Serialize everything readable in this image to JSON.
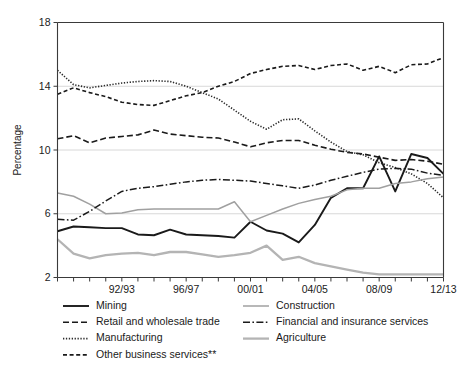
{
  "figure": {
    "background_color": "#ffffff",
    "axis_color": "#3a3a3a",
    "grid_color": "#d8d8d8"
  },
  "chart_data": {
    "type": "line",
    "title": "",
    "xlabel": "",
    "ylabel": "Percentage",
    "ylim": [
      2,
      18
    ],
    "yticks": [
      2,
      6,
      10,
      14,
      18
    ],
    "ytick_labels": [
      "2",
      "6",
      "10",
      "14",
      "18"
    ],
    "grid": true,
    "grid_axis": "y",
    "legend_position": "below-axes",
    "legend_columns": 2,
    "x": [
      "88/89",
      "89/90",
      "90/91",
      "91/92",
      "92/93",
      "93/94",
      "94/95",
      "95/96",
      "96/97",
      "97/98",
      "98/99",
      "99/00",
      "00/01",
      "01/02",
      "02/03",
      "03/04",
      "04/05",
      "05/06",
      "06/07",
      "07/08",
      "08/09",
      "09/10",
      "10/11",
      "11/12",
      "12/13"
    ],
    "xtick_labels": [
      "92/93",
      "96/97",
      "00/01",
      "04/05",
      "08/09",
      "12/13"
    ],
    "xtick_label_indices": [
      4,
      8,
      12,
      16,
      20,
      24
    ],
    "series": [
      {
        "name": "Mining",
        "color": "#1a1a1a",
        "dash": "none",
        "width": 1.9,
        "values": [
          4.9,
          5.2,
          5.15,
          5.1,
          5.1,
          4.7,
          4.65,
          5.0,
          4.7,
          4.65,
          4.6,
          4.5,
          5.5,
          4.95,
          4.75,
          4.2,
          5.3,
          7.0,
          7.6,
          7.6,
          9.6,
          7.4,
          9.75,
          9.5,
          8.5
        ]
      },
      {
        "name": "Retail and wholesale trade",
        "color": "#1a1a1a",
        "dash": "dashed",
        "width": 1.6,
        "values": [
          10.7,
          10.9,
          10.45,
          10.75,
          10.85,
          10.95,
          11.25,
          11.0,
          10.9,
          10.8,
          10.75,
          10.5,
          10.2,
          10.45,
          10.6,
          10.6,
          10.3,
          10.05,
          9.85,
          9.75,
          9.55,
          9.35,
          9.4,
          9.3,
          9.1
        ]
      },
      {
        "name": "Manufacturing",
        "color": "#2b2b2b",
        "dash": "dotted",
        "width": 1.6,
        "values": [
          15.0,
          14.1,
          13.9,
          14.05,
          14.2,
          14.3,
          14.35,
          14.3,
          14.0,
          13.6,
          13.2,
          12.5,
          11.8,
          11.3,
          11.9,
          11.95,
          11.2,
          10.5,
          9.9,
          9.7,
          9.2,
          8.9,
          8.5,
          7.9,
          7.0
        ]
      },
      {
        "name": "Other business services**",
        "color": "#1a1a1a",
        "dash": "dash-short",
        "width": 1.6,
        "values": [
          13.5,
          13.9,
          13.6,
          13.35,
          13.0,
          12.85,
          12.8,
          13.1,
          13.4,
          13.6,
          14.0,
          14.3,
          14.8,
          15.05,
          15.25,
          15.3,
          15.05,
          15.3,
          15.4,
          15.0,
          15.25,
          14.85,
          15.35,
          15.4,
          15.8
        ]
      },
      {
        "name": "Construction",
        "color": "#a0a0a0",
        "dash": "none",
        "width": 1.5,
        "values": [
          7.3,
          7.1,
          6.6,
          6.0,
          6.05,
          6.25,
          6.3,
          6.3,
          6.3,
          6.3,
          6.3,
          6.75,
          5.5,
          5.9,
          6.3,
          6.65,
          6.9,
          7.1,
          7.5,
          7.6,
          7.6,
          7.9,
          8.0,
          8.2,
          8.3
        ]
      },
      {
        "name": "Financial and insurance services",
        "color": "#1a1a1a",
        "dash": "dash-dot",
        "width": 1.5,
        "values": [
          5.65,
          5.6,
          6.15,
          6.8,
          7.4,
          7.6,
          7.7,
          7.85,
          8.0,
          8.1,
          8.15,
          8.1,
          8.05,
          7.9,
          7.75,
          7.6,
          7.8,
          8.1,
          8.35,
          8.6,
          8.8,
          8.85,
          8.8,
          8.55,
          8.4
        ]
      },
      {
        "name": "Agriculture",
        "color": "#b4b4b4",
        "dash": "none",
        "width": 2.3,
        "values": [
          4.4,
          3.5,
          3.2,
          3.4,
          3.5,
          3.55,
          3.4,
          3.6,
          3.6,
          3.45,
          3.3,
          3.4,
          3.55,
          4.0,
          3.1,
          3.3,
          2.9,
          2.7,
          2.5,
          2.3,
          2.2,
          2.2,
          2.2,
          2.2,
          2.2
        ]
      }
    ]
  },
  "legend": {
    "column_left": [
      {
        "label": "Mining",
        "series": "Mining"
      },
      {
        "label": "Retail and wholesale trade",
        "series": "Retail and wholesale trade"
      },
      {
        "label": "Manufacturing",
        "series": "Manufacturing"
      },
      {
        "label": "Other business services**",
        "series": "Other business services**"
      }
    ],
    "column_right": [
      {
        "label": "Construction",
        "series": "Construction"
      },
      {
        "label": "Financial and insurance services",
        "series": "Financial and insurance services"
      },
      {
        "label": "Agriculture",
        "series": "Agriculture"
      }
    ]
  }
}
